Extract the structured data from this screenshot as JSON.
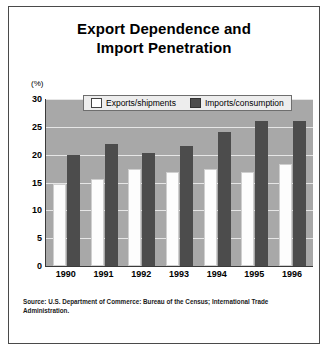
{
  "chart_data": {
    "type": "bar",
    "title": "Export Dependence and Import Penetration",
    "title_line1": "Export Dependence and",
    "title_line2": "Import Penetration",
    "xlabel": "",
    "ylabel": "(%)",
    "ylim": [
      0,
      30
    ],
    "yticks": [
      30,
      25,
      20,
      15,
      10,
      5,
      0
    ],
    "grid": true,
    "legend_position": "top-center",
    "categories": [
      "1990",
      "1991",
      "1992",
      "1993",
      "1994",
      "1995",
      "1996"
    ],
    "series": [
      {
        "name": "Exports/shipments",
        "color": "#ffffff",
        "values": [
          14.8,
          15.6,
          17.5,
          16.9,
          17.4,
          16.9,
          18.4
        ]
      },
      {
        "name": "Imports/consumption",
        "color": "#4c4c4c",
        "values": [
          20.0,
          22.0,
          20.3,
          21.6,
          24.0,
          26.0,
          26.1
        ]
      }
    ],
    "source": "Source: U.S. Department of Commerce: Bureau of the Census; International Trade Administration.",
    "plot_background": "#a8a8a8",
    "gridline_color": "#e6e6e6"
  }
}
